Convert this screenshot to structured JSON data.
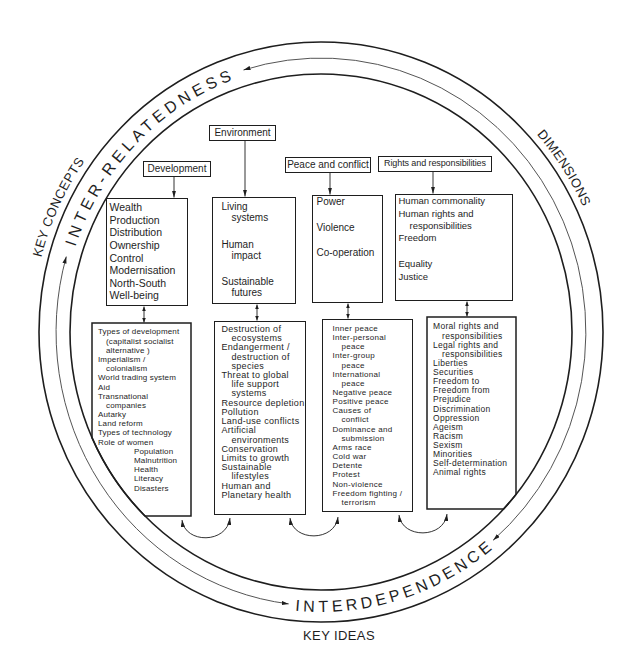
{
  "colors": {
    "ink": "#1e1e1e",
    "background": "#ffffff"
  },
  "rings": {
    "top": "INTER-RELATEDNESS",
    "bottom": "INTERDEPENDENCE"
  },
  "outer_labels": {
    "key_concepts": "KEY CONCEPTS",
    "dimensions": "DIMENSIONS",
    "key_ideas": "KEY IDEAS"
  },
  "dimensions": [
    {
      "title": "Development",
      "concepts": [
        "Wealth",
        "Production",
        "Distribution",
        "Ownership",
        "Control",
        "Modernisation",
        "North-South",
        "Well-being"
      ],
      "topics": [
        "Types of development",
        "(capitalist socialist",
        "alternative )",
        "Imperialism /",
        "colonialism",
        "World trading system",
        "Aid",
        "Transnational",
        "companies",
        "Autarky",
        "Land reform",
        "Types of technology",
        "Role of women",
        "Population",
        "Malnutrition",
        "Health",
        "Literacy",
        "Disasters"
      ]
    },
    {
      "title": "Environment",
      "concepts": [
        "Living",
        "systems",
        "Human",
        "impact",
        "Sustainable",
        "futures"
      ],
      "topics": [
        "Destruction of",
        "ecosystems",
        "Endangerment /",
        "destruction of",
        "species",
        "Threat to global",
        "life support",
        "systems",
        "Resource depletion",
        "Pollution",
        "Land-use conflicts",
        "Artificial",
        "environments",
        "Conservation",
        "Limits to growth",
        "Sustainable",
        "lifestyles",
        "Human and",
        "Planetary health"
      ]
    },
    {
      "title": "Peace and conflict",
      "concepts": [
        "Power",
        "Violence",
        "Co-operation"
      ],
      "topics": [
        "Inner peace",
        "Inter-personal",
        "peace",
        "Inter-group",
        "peace",
        "International",
        "peace",
        "Negative peace",
        "Positive peace",
        "Causes of",
        "conflict",
        "Dominance and",
        "submission",
        "Arms race",
        "Cold war",
        "Detente",
        "Protest",
        "Non-violence",
        "Freedom fighting /",
        "terrorism"
      ]
    },
    {
      "title": "Rights and responsibilities",
      "concepts": [
        "Human commonality",
        "Human rights and",
        "responsibilities",
        "Freedom",
        "Equality",
        "Justice"
      ],
      "topics": [
        "Moral rights and",
        "responsibilities",
        "Legal rights and",
        "responsibilities",
        "Liberties",
        "Securities",
        "Freedom to",
        "Freedom from",
        "Prejudice",
        "Discrimination",
        "Oppression",
        "Ageism",
        "Racism",
        "Sexism",
        "Minorities",
        "Self-determination",
        "Animal rights"
      ]
    }
  ]
}
